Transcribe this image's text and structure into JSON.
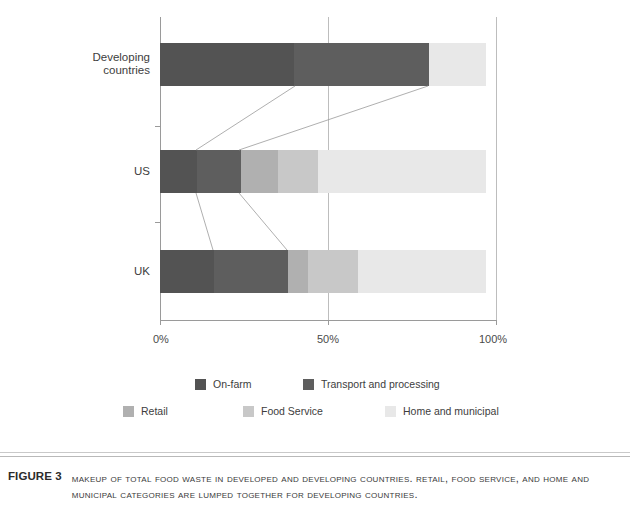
{
  "chart_data": {
    "type": "bar",
    "orientation": "horizontal",
    "stacked": true,
    "stack_mode": "percent",
    "title": "",
    "xlabel": "",
    "ylabel": "",
    "xlim": [
      0,
      100
    ],
    "x_ticks": [
      "0%",
      "50%",
      "100%"
    ],
    "x_tick_values": [
      0,
      50,
      100
    ],
    "grid": true,
    "grid_axis": "x",
    "legend_position": "bottom",
    "categories": [
      "Developing countries",
      "US",
      "UK"
    ],
    "series": [
      {
        "name": "On-farm",
        "color": "#535353",
        "values": [
          40,
          11,
          16
        ]
      },
      {
        "name": "Transport and processing",
        "color": "#5e5e5e",
        "values": [
          40,
          13,
          22
        ]
      },
      {
        "name": "Retail",
        "color": "#b0b0b0",
        "values": [
          0,
          11,
          6
        ]
      },
      {
        "name": "Food Service",
        "color": "#c8c8c8",
        "values": [
          0,
          12,
          15
        ]
      },
      {
        "name": "Home and municipal",
        "color": "#e8e8e8",
        "values": [
          17,
          50,
          38
        ]
      }
    ]
  },
  "axis": {
    "x_ticks": [
      {
        "label": "0%",
        "value": 0
      },
      {
        "label": "50%",
        "value": 50
      },
      {
        "label": "100%",
        "value": 100
      }
    ],
    "y_labels": [
      {
        "label": "Developing\ncountries"
      },
      {
        "label": "US"
      },
      {
        "label": "UK"
      }
    ]
  },
  "legend": {
    "items": [
      {
        "label": "On-farm",
        "color": "#535353"
      },
      {
        "label": "Transport and processing",
        "color": "#5e5e5e"
      },
      {
        "label": "Retail",
        "color": "#b0b0b0"
      },
      {
        "label": "Food Service",
        "color": "#c8c8c8"
      },
      {
        "label": "Home and municipal",
        "color": "#e8e8e8"
      }
    ]
  },
  "caption": {
    "label": "FIGURE 3",
    "text": "Makeup of total food waste in developed and developing countries. Retail, food service, and home and municipal categories are lumped together for developing countries."
  }
}
